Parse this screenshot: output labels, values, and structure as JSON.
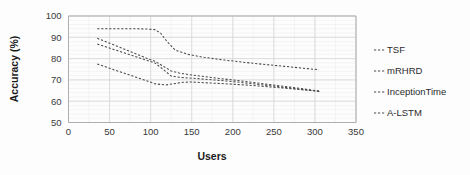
{
  "chart_data": {
    "type": "line",
    "title": "",
    "xlabel": "Users",
    "ylabel": "Accuracy (%)",
    "xlim": [
      0,
      350
    ],
    "ylim": [
      50,
      100
    ],
    "xticks": [
      "0",
      "50",
      "100",
      "150",
      "200",
      "250",
      "300",
      "350"
    ],
    "yticks": [
      "50",
      "60",
      "70",
      "80",
      "90",
      "100"
    ],
    "grid": true,
    "legend_position": "right",
    "line_style": "dashed",
    "line_color": "#4a4a4a",
    "series": [
      {
        "name": "TSF",
        "x": [
          35,
          50,
          65,
          80,
          95,
          105,
          112,
          120,
          130,
          145,
          165,
          190,
          215,
          240,
          265,
          290,
          305
        ],
        "y": [
          94.0,
          94.0,
          94.0,
          94.0,
          93.9,
          93.6,
          92.0,
          88.0,
          84.0,
          82.0,
          80.6,
          79.3,
          78.2,
          77.2,
          76.3,
          75.3,
          74.8
        ]
      },
      {
        "name": "mRHRD",
        "x": [
          35,
          55,
          75,
          95,
          105,
          115,
          125,
          135,
          150,
          170,
          195,
          220,
          245,
          270,
          295,
          307
        ],
        "y": [
          89.5,
          86.5,
          83.3,
          80.2,
          78.8,
          76.5,
          74.2,
          73.2,
          72.3,
          71.3,
          70.2,
          69.0,
          67.8,
          66.6,
          65.3,
          64.7
        ]
      },
      {
        "name": "InceptionTime",
        "x": [
          35,
          55,
          75,
          95,
          105,
          115,
          125,
          135,
          150,
          170,
          195,
          220,
          245,
          270,
          295,
          307
        ],
        "y": [
          86.8,
          84.3,
          81.8,
          79.2,
          78.0,
          75.0,
          71.8,
          71.2,
          70.8,
          70.2,
          69.4,
          68.4,
          67.3,
          66.2,
          65.1,
          64.6
        ]
      },
      {
        "name": "A-LSTM",
        "x": [
          35,
          55,
          75,
          95,
          105,
          118,
          130,
          140,
          150,
          170,
          195,
          220,
          245,
          270,
          295,
          307
        ],
        "y": [
          77.5,
          74.8,
          72.2,
          69.6,
          68.2,
          67.6,
          68.3,
          68.9,
          69.0,
          68.6,
          68.1,
          67.5,
          66.7,
          65.9,
          65.0,
          64.5
        ]
      }
    ]
  },
  "legend": {
    "items": [
      {
        "label": "TSF"
      },
      {
        "label": "mRHRD"
      },
      {
        "label": "InceptionTime"
      },
      {
        "label": "A-LSTM"
      }
    ]
  }
}
